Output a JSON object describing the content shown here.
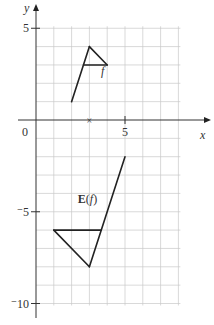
{
  "diagram": {
    "axes": {
      "x_label": "x",
      "y_label": "y",
      "origin_label": "0",
      "x_ticks": [
        {
          "value": 5,
          "label": "5"
        }
      ],
      "y_ticks": [
        {
          "value": 5,
          "label": "5"
        },
        {
          "value": -5,
          "label": "⁻5"
        },
        {
          "value": -10,
          "label": "⁻10"
        }
      ],
      "x_range": [
        -1,
        8
      ],
      "y_range": [
        -11,
        6
      ]
    },
    "grid": {
      "on": true,
      "x_from": 0,
      "x_to": 8,
      "y_from": -10,
      "y_to": 5,
      "step": 1,
      "color": "#c8c8c8"
    },
    "marker": {
      "x": 3,
      "y": 0,
      "symbol": "×"
    },
    "shapes": [
      {
        "name": "f",
        "label": "f",
        "label_pos": [
          3.65,
          2.45
        ],
        "segments": [
          [
            [
              2,
              1
            ],
            [
              3,
              4
            ]
          ],
          [
            [
              3,
              4
            ],
            [
              4,
              3
            ]
          ],
          [
            [
              2.67,
              3
            ],
            [
              4,
              3
            ]
          ]
        ]
      },
      {
        "name": "E(f)",
        "label": "E(f)",
        "label_pos": [
          2.35,
          -4.55
        ],
        "segments": [
          [
            [
              5,
              -2
            ],
            [
              3,
              -8
            ]
          ],
          [
            [
              3,
              -8
            ],
            [
              1,
              -6
            ]
          ],
          [
            [
              1,
              -6
            ],
            [
              3.67,
              -6
            ]
          ]
        ]
      }
    ],
    "colors": {
      "line": "#222222",
      "axis": "#333333",
      "grid": "#c8c8c8"
    }
  }
}
